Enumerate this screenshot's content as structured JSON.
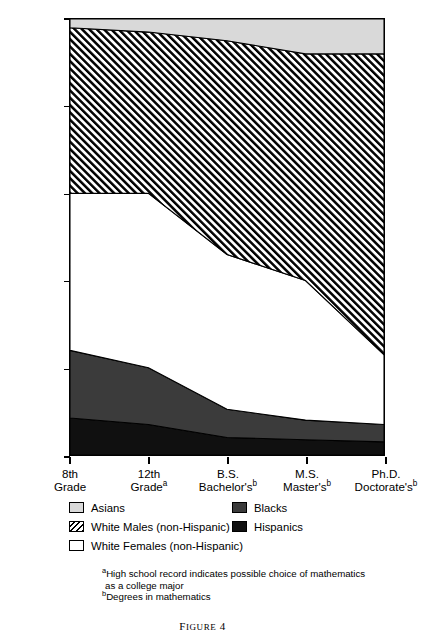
{
  "chart_data": {
    "type": "area",
    "title": "",
    "subtitle": "",
    "xlabel": "",
    "ylabel": "PERCENT OF PIPELINE POPULATION",
    "ylim": [
      0,
      100
    ],
    "yticks": [
      0,
      20,
      40,
      60,
      80,
      100
    ],
    "ytick_labels": [
      "0",
      "20",
      "40",
      "60",
      "80",
      "100"
    ],
    "grid": false,
    "legend_position": "below-axes",
    "stacked": true,
    "stack_order_bottom_to_top": [
      "Hispanics",
      "Blacks",
      "White Females (non-Hispanic)",
      "White Males (non-Hispanic)",
      "Asians"
    ],
    "categories": [
      "8th Grade",
      "12th Grade",
      "B.S. Bachelor's",
      "M.S. Master's",
      "Ph.D. Doctorate's"
    ],
    "xtick_labels": [
      {
        "line1": "8th",
        "line2": "Grade",
        "footnote": ""
      },
      {
        "line1": "12th",
        "line2": "Grade",
        "footnote": "a"
      },
      {
        "line1": "B.S.",
        "line2": "Bachelor's",
        "footnote": "b"
      },
      {
        "line1": "M.S.",
        "line2": "Master's",
        "footnote": "b"
      },
      {
        "line1": "Ph.D.",
        "line2": "Doctorate's",
        "footnote": "b"
      }
    ],
    "series": [
      {
        "name": "Hispanics",
        "values": [
          8.5,
          7.0,
          4.0,
          3.5,
          3.0
        ],
        "color": "#101010",
        "pattern": "solid"
      },
      {
        "name": "Blacks",
        "values": [
          15.5,
          13.0,
          6.5,
          4.5,
          4.0
        ],
        "color": "#3b3b3b",
        "pattern": "solid"
      },
      {
        "name": "White Females (non-Hispanic)",
        "values": [
          36.0,
          40.0,
          35.5,
          32.0,
          16.0
        ],
        "color": "#ffffff",
        "pattern": "solid"
      },
      {
        "name": "White Males (non-Hispanic)",
        "values": [
          38.0,
          37.0,
          49.0,
          52.0,
          69.0
        ],
        "color": "#000000",
        "pattern": "diagonal-hatch"
      },
      {
        "name": "Asians",
        "values": [
          2.0,
          3.0,
          5.0,
          8.0,
          8.0
        ],
        "color": "#d9d9d9",
        "pattern": "solid"
      }
    ],
    "cumulative_upper_bounds": {
      "Hispanics": [
        8.5,
        7.0,
        4.0,
        3.5,
        3.0
      ],
      "Blacks": [
        24.0,
        20.0,
        10.5,
        8.0,
        7.0
      ],
      "White Females (non-Hispanic)": [
        60.0,
        60.0,
        46.0,
        40.0,
        23.0
      ],
      "White Males (non-Hispanic)": [
        98.0,
        97.0,
        95.0,
        92.0,
        92.0
      ],
      "Asians": [
        100.0,
        100.0,
        100.0,
        100.0,
        100.0
      ]
    }
  },
  "legend": {
    "left_column": [
      {
        "label": "Asians",
        "swatch": "asians"
      },
      {
        "label": "White Males (non-Hispanic)",
        "swatch": "whitemales"
      },
      {
        "label": "White Females (non-Hispanic)",
        "swatch": "whitefemales"
      }
    ],
    "right_column": [
      {
        "label": "Blacks",
        "swatch": "blacks"
      },
      {
        "label": "Hispanics",
        "swatch": "hispanics"
      }
    ]
  },
  "footnotes": {
    "a_marker": "a",
    "a_text": "High school record indicates possible choice of mathematics",
    "a_text_cont": "as a college major",
    "b_marker": "b",
    "b_text": "Degrees in mathematics"
  },
  "caption": {
    "prefix": "F",
    "rest": "IGURE",
    "number": "4",
    "full": "FIGURE 4"
  },
  "colors": {
    "asians": "#d9d9d9",
    "white_males": "#000000",
    "white_females": "#ffffff",
    "blacks": "#3b3b3b",
    "hispanics": "#101010",
    "axis": "#000000",
    "background": "#ffffff"
  }
}
